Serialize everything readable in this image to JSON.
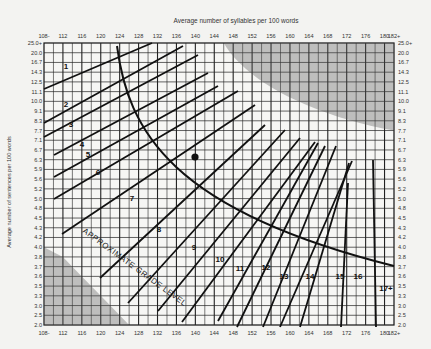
{
  "chart_data": {
    "type": "line",
    "title": "Average number of syllables per 100 words",
    "xlabel": "Average number of syllables per 100 words",
    "ylabel": "Average number of sentences per 100 words",
    "x_tick_labels": [
      "108-",
      "112",
      "116",
      "120",
      "124",
      "128",
      "132",
      "136",
      "140",
      "144",
      "148",
      "152",
      "156",
      "160",
      "164",
      "168",
      "172",
      "176",
      "180",
      "182+"
    ],
    "y_tick_labels": [
      "25.0+",
      "20.0",
      "16.7",
      "14.3",
      "12.5",
      "11.1",
      "10.0",
      "9.1",
      "8.3",
      "7.7",
      "7.1",
      "6.7",
      "6.3",
      "5.9",
      "5.6",
      "5.2",
      "5.0",
      "4.8",
      "4.5",
      "4.3",
      "4.2",
      "4.0",
      "3.8",
      "3.7",
      "3.6",
      "3.5",
      "3.3",
      "3.0",
      "2.5",
      "2.0"
    ],
    "xlim": [
      108,
      182
    ],
    "ylim_rows": [
      0,
      29
    ],
    "grid": true,
    "annotation_curve_label": "APPROXIMATE GRADE LEVEL",
    "grade_levels": [
      "1",
      "2",
      "3",
      "4",
      "5",
      "6",
      "7",
      "8",
      "9",
      "10",
      "11",
      "12",
      "13",
      "14",
      "15",
      "16",
      "17+"
    ],
    "sample_point": {
      "x_syllables": 141,
      "y_row_label": "6.7"
    },
    "shaded_regions": [
      "upper-right invalid region",
      "lower-left invalid region"
    ]
  },
  "labels": {
    "title": "Average number of syllables per 100 words",
    "y_axis": "Average number of sentences per 100 words",
    "curve": "APPROXIMATE GRADE LEVEL"
  }
}
